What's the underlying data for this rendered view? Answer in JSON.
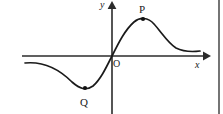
{
  "figure": {
    "background_color": "#ffffff",
    "ink_color": "#1a1a1a",
    "width": 223,
    "height": 114,
    "frame": {
      "right_border_visible": true,
      "right_border_x": 219
    }
  },
  "axes": {
    "x_label": "x",
    "y_label": "y",
    "origin_label": "O",
    "x_axis": {
      "y_pixel": 56,
      "x_start": 22,
      "x_end": 206,
      "arrow": "right"
    },
    "y_axis": {
      "x_pixel": 112,
      "y_start": 114,
      "y_end": 4,
      "arrow": "up"
    }
  },
  "points": [
    {
      "name": "P",
      "label": "P",
      "role": "local-maximum",
      "x": 143,
      "y": 19,
      "label_offset": {
        "dx": -4,
        "dy": -15
      }
    },
    {
      "name": "Q",
      "label": "Q",
      "role": "local-minimum",
      "x": 85,
      "y": 88,
      "label_offset": {
        "dx": -5,
        "dy": 9
      }
    }
  ],
  "chart_data": {
    "type": "line",
    "title": "",
    "xlabel": "x",
    "ylabel": "y",
    "grid": false,
    "legend": null,
    "annotations": [
      {
        "text": "P",
        "x": 143,
        "y": 19,
        "note": "local maximum, marked with filled dot"
      },
      {
        "text": "Q",
        "x": 85,
        "y": 88,
        "note": "local minimum, marked with filled dot"
      },
      {
        "text": "O",
        "x": 112,
        "y": 56,
        "note": "origin label, placed to the lower-right of the origin"
      }
    ],
    "curve_path": "M 25,63 C 45,61 60,70 72,82 C 80,89 86,91 93,86 C 100,80 105,70 112,56 C 119,42 125,30 134,22 C 140,17 148,17 154,24 C 162,33 168,43 176,48 C 184,52 192,52 200,51"
  }
}
